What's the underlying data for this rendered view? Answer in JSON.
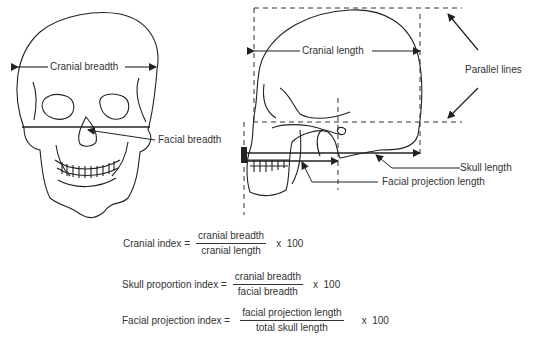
{
  "front_view": {
    "labels": {
      "cranial_breadth": "Cranial breadth",
      "facial_breadth": "Facial breadth"
    }
  },
  "side_view": {
    "labels": {
      "cranial_length": "Cranial length",
      "parallel_lines": "Parallel lines",
      "skull_length": "Skull length",
      "facial_projection_length": "Facial projection length"
    }
  },
  "formulas": [
    {
      "name": "Cranial index =",
      "numerator": "cranial breadth",
      "denominator": "cranial length",
      "multiplier": "x  100"
    },
    {
      "name": "Skull proportion index =",
      "numerator": "cranial breadth",
      "denominator": "facial breadth",
      "multiplier": "x  100"
    },
    {
      "name": "Facial projection index =",
      "numerator": "facial projection length",
      "denominator": "total skull length",
      "multiplier": "x  100"
    }
  ]
}
